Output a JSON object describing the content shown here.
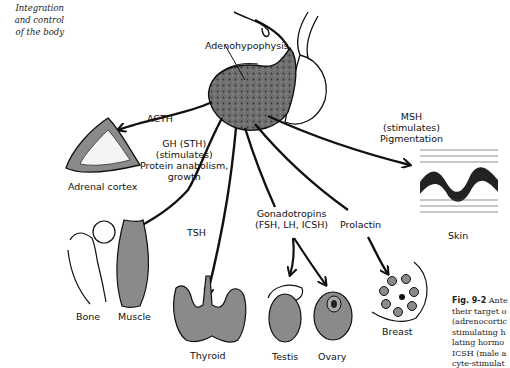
{
  "side_heading": [
    "Integration",
    "and control",
    "of the body"
  ],
  "gland": {
    "label": "Adenohypophysis"
  },
  "hormones": {
    "acth": {
      "lines": [
        "ACTH"
      ]
    },
    "gh": {
      "lines": [
        "GH (STH)",
        "(stimulates)",
        "Protein anabolism,",
        "growth"
      ]
    },
    "msh": {
      "lines": [
        "MSH",
        "(stimulates)",
        "Pigmentation"
      ]
    },
    "tsh": {
      "lines": [
        "TSH"
      ]
    },
    "gonadotropins": {
      "lines": [
        "Gonadotropins",
        "(FSH, LH, ICSH)"
      ]
    },
    "prolactin": {
      "lines": [
        "Prolactin"
      ]
    }
  },
  "targets": {
    "adrenal_cortex": "Adrenal cortex",
    "skin": "Skin",
    "bone": "Bone",
    "muscle": "Muscle",
    "thyroid": "Thyroid",
    "testis": "Testis",
    "ovary": "Ovary",
    "breast": "Breast"
  },
  "caption": {
    "fig_label": "Fig. 9-2",
    "lines": [
      "Ante",
      "their target o",
      "(adrenocortic",
      "stimulating h",
      "lating hormo",
      "ICSH (male a",
      "cyte-stimulat"
    ]
  },
  "colors": {
    "ink": "#111111",
    "organ_fill": "#8a8a8a",
    "gland_fill": "#6e6e6e"
  }
}
